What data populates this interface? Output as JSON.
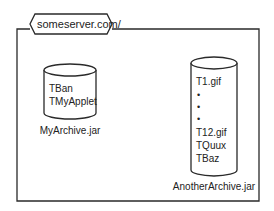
{
  "diagram": {
    "server": {
      "label": "someserver.com/"
    },
    "archives": [
      {
        "name": "MyArchive.jar",
        "contents": [
          "TBan",
          "TMyApplet"
        ]
      },
      {
        "name": "AnotherArchive.jar",
        "contents": [
          "T1.gif",
          "•",
          "•",
          "•",
          "T12.gif",
          "TQuux",
          "TBaz"
        ]
      }
    ]
  },
  "colors": {
    "stroke": "#2a2a2a",
    "background": "#ffffff",
    "text": "#222222"
  }
}
